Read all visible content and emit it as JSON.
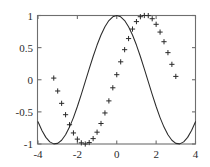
{
  "chart_data": {
    "type": "line",
    "title": "",
    "xlabel": "",
    "ylabel": "",
    "xlim": [
      -4,
      4
    ],
    "ylim": [
      -1,
      1
    ],
    "grid": false,
    "legend": "none",
    "xticks": [
      -4,
      -2,
      0,
      2,
      4
    ],
    "xticklabels": [
      "-4",
      "-2",
      "0",
      "2",
      "4"
    ],
    "yticks": [
      -1,
      -0.5,
      0,
      0.5,
      1
    ],
    "yticklabels": [
      "-1",
      "-0.5",
      "0",
      "0.5",
      "1"
    ],
    "series": [
      {
        "name": "cos(x)",
        "style": "solid-line",
        "marker": "none",
        "color": "#2a2a2a",
        "x": [
          -4,
          -3.8,
          -3.6,
          -3.4,
          -3.2,
          -3,
          -2.8,
          -2.6,
          -2.4,
          -2.2,
          -2,
          -1.8,
          -1.6,
          -1.4,
          -1.2,
          -1,
          -0.8,
          -0.6,
          -0.4,
          -0.2,
          0,
          0.2,
          0.4,
          0.6,
          0.8,
          1,
          1.2,
          1.4,
          1.6,
          1.8,
          2,
          2.2,
          2.4,
          2.6,
          2.8,
          3,
          3.2,
          3.4,
          3.6,
          3.8,
          4
        ],
        "y": [
          -0.654,
          -0.791,
          -0.897,
          -0.967,
          -0.998,
          -0.99,
          -0.942,
          -0.857,
          -0.737,
          -0.589,
          -0.416,
          -0.227,
          -0.029,
          0.17,
          0.362,
          0.54,
          0.697,
          0.825,
          0.921,
          0.98,
          1,
          0.98,
          0.921,
          0.825,
          0.697,
          0.54,
          0.362,
          0.17,
          -0.029,
          -0.227,
          -0.416,
          -0.589,
          -0.737,
          -0.857,
          -0.942,
          -0.99,
          -0.998,
          -0.967,
          -0.897,
          -0.791,
          -0.654
        ]
      },
      {
        "name": "cos(x - 1.65)",
        "style": "markers-only",
        "marker": "plus",
        "color": "#2a2a2a",
        "x": [
          -3.2,
          -3.0,
          -2.8,
          -2.6,
          -2.4,
          -2.2,
          -2.0,
          -1.8,
          -1.6,
          -1.4,
          -1.2,
          -1.0,
          -0.8,
          -0.6,
          -0.4,
          -0.2,
          0.0,
          0.2,
          0.4,
          0.6,
          0.8,
          1.0,
          1.2,
          1.4,
          1.6,
          1.8,
          2.0,
          2.2,
          2.4,
          2.6,
          2.8,
          3.0
        ],
        "y": [
          0.026,
          -0.175,
          -0.367,
          -0.544,
          -0.7,
          -0.828,
          -0.924,
          -0.982,
          -1.0,
          -0.978,
          -0.916,
          -0.816,
          -0.681,
          -0.517,
          -0.329,
          -0.125,
          0.079,
          0.279,
          0.468,
          0.641,
          0.789,
          0.905,
          0.981,
          1.0,
          0.998,
          0.95,
          0.863,
          0.742,
          0.592,
          0.422,
          0.24,
          0.052
        ]
      }
    ]
  },
  "figure": {
    "background_color": "#ffffff",
    "axis_color": "#6e6e6e",
    "data_color": "#2a2a2a"
  }
}
